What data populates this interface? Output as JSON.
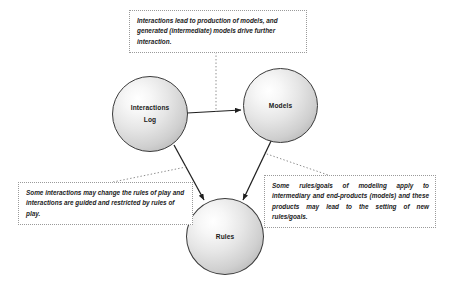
{
  "diagram": {
    "nodes": [
      {
        "id": "interactions-log",
        "label": "Interactions\nLog",
        "line1": "Interactions",
        "line2": "Log"
      },
      {
        "id": "models",
        "label": "Models",
        "line1": "Models",
        "line2": ""
      },
      {
        "id": "rules",
        "label": "Rules",
        "line1": "Rules",
        "line2": ""
      }
    ],
    "notes": [
      {
        "id": "note-top",
        "text": "Interactions lead to production of models, and generated (intermediate) models drive further interaction."
      },
      {
        "id": "note-left",
        "text": "Some interactions may change the rules of play and interactions are guided and restricted by rules of play."
      },
      {
        "id": "note-right",
        "text": "Some rules/goals of modeling apply to intermediary and end-products (models) and these products may lead to the setting of new rules/goals."
      }
    ],
    "connectors": [
      {
        "id": "log-to-models",
        "from": "interactions-log",
        "to": "models",
        "style": "solid-arrow"
      },
      {
        "id": "log-to-rules",
        "from": "interactions-log",
        "to": "rules",
        "style": "solid-arrow"
      },
      {
        "id": "models-to-rules",
        "from": "models",
        "to": "rules",
        "style": "solid-arrow"
      }
    ],
    "leaders": [
      {
        "id": "leader-top",
        "from": "note-top",
        "to": "log-to-models",
        "style": "dotted"
      },
      {
        "id": "leader-left",
        "from": "note-left",
        "to": "log-to-rules",
        "style": "dotted"
      },
      {
        "id": "leader-right",
        "from": "note-right",
        "to": "models-to-rules",
        "style": "dotted"
      }
    ],
    "colors": {
      "node_stroke": "#3a3a3a",
      "connector": "#1f1f1f",
      "note_border": "#9a9a9a",
      "text": "#1b1b1b",
      "background": "#ffffff"
    }
  }
}
